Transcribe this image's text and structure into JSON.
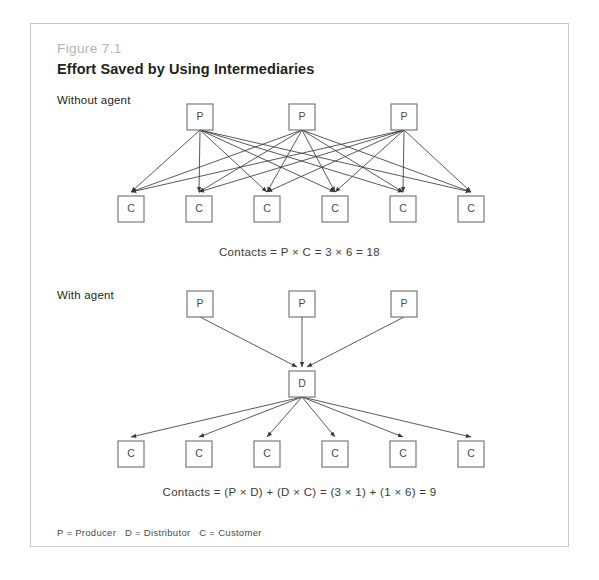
{
  "figure": {
    "number": "Figure 7.1",
    "title": "Effort Saved by Using Intermediaries"
  },
  "sections": {
    "without_agent": {
      "label": "Without agent",
      "caption": "Contacts = P × C = 3 × 6 = 18"
    },
    "with_agent": {
      "label": "With agent",
      "caption": "Contacts = (P × D) + (D × C) = (3 × 1) + (1 × 6) = 9"
    }
  },
  "legend": "P = Producer   D = Distributor   C = Customer",
  "node_labels": {
    "producer": "P",
    "distributor": "D",
    "customer": "C"
  },
  "colors": {
    "frame_border": "#c9c9c9",
    "figure_number": "#b3b3b3",
    "title": "#231f20",
    "node_stroke": "#6d6d6d",
    "edge_stroke": "#3b3b3b",
    "node_text": "#4a4a4a"
  },
  "diagram": {
    "box_size": 26,
    "producers_top": [
      {
        "x": 156,
        "y": 80
      },
      {
        "x": 258,
        "y": 80
      },
      {
        "x": 360,
        "y": 80
      }
    ],
    "customers_top": [
      {
        "x": 87,
        "y": 172
      },
      {
        "x": 155,
        "y": 172
      },
      {
        "x": 223,
        "y": 172
      },
      {
        "x": 291,
        "y": 172
      },
      {
        "x": 359,
        "y": 172
      },
      {
        "x": 427,
        "y": 172
      }
    ],
    "producers_bottom": [
      {
        "x": 156,
        "y": 267
      },
      {
        "x": 258,
        "y": 267
      },
      {
        "x": 360,
        "y": 267
      }
    ],
    "distributor": {
      "x": 258,
      "y": 347
    },
    "customers_bottom": [
      {
        "x": 87,
        "y": 417
      },
      {
        "x": 155,
        "y": 417
      },
      {
        "x": 223,
        "y": 417
      },
      {
        "x": 291,
        "y": 417
      },
      {
        "x": 359,
        "y": 417
      },
      {
        "x": 427,
        "y": 417
      }
    ]
  }
}
